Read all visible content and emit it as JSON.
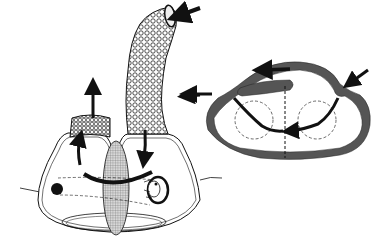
{
  "diagram": {
    "title": "",
    "colors": {
      "background": "#ffffff",
      "outline": "#111111",
      "arrow": "#111111",
      "section_wall": "#555555",
      "hatch": "#777777"
    },
    "left_figure": {
      "parts": [
        "tall-textured-inhalant-siphon",
        "short-textured-exhalant-siphon",
        "body-outline",
        "hatched-central-oval",
        "dark-dot",
        "coiled-organ",
        "basal-disc"
      ],
      "arrows": [
        "inflow-top-right",
        "inflow-side",
        "outflow-up",
        "internal-curve-down",
        "internal-curve-up",
        "internal-bottom-curve"
      ]
    },
    "right_figure": {
      "parts": [
        "thick-oval-wall",
        "inner-dark-lobe",
        "dashed-midline",
        "dashed-circle-left",
        "dashed-circle-right"
      ],
      "arrows": [
        "inflow-right",
        "outflow-left",
        "top-internal-left",
        "inner-left-down",
        "inner-right-down"
      ]
    },
    "labels": []
  }
}
